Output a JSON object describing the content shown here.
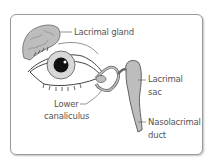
{
  "diagram": {
    "type": "anatomical illustration",
    "colors": {
      "frame": "#9a9a9a",
      "tissue_fill": "#bdbdbd",
      "outline": "#555555",
      "label_text": "#555555"
    },
    "labels": {
      "lacrimal_gland": "Lacrimal gland",
      "lacrimal_sac_line1": "Lacrimal",
      "lacrimal_sac_line2": "sac",
      "lower_canaliculus_line1": "Lower",
      "lower_canaliculus_line2": "canaliculus",
      "nasolacrimal_duct_line1": "Nasolacrimal",
      "nasolacrimal_duct_line2": "duct"
    }
  }
}
